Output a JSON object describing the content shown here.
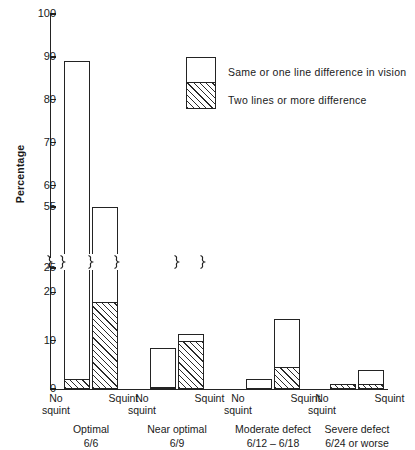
{
  "chart_data": {
    "type": "bar",
    "subtype": "stacked-grouped",
    "title": "",
    "xlabel": "",
    "ylabel": "Percentage",
    "ylim": [
      0,
      100
    ],
    "axis_break": {
      "present": true,
      "gap_from": 25,
      "gap_to": 55
    },
    "ytick_labels": [
      "0",
      "10",
      "20",
      "25",
      "55",
      "60",
      "70",
      "80",
      "90",
      "100"
    ],
    "ytick_values": [
      0,
      10,
      20,
      25,
      55,
      60,
      70,
      80,
      90,
      100
    ],
    "grid": false,
    "legend_position": "upper-right",
    "legend": [
      {
        "key": "same_or_one_line",
        "label": "Same or one line difference in vision",
        "fill": "white"
      },
      {
        "key": "two_or_more_lines",
        "label": "Two lines or more difference",
        "fill": "hatched"
      }
    ],
    "categories": [
      {
        "label": "Optimal",
        "sub": "6/6"
      },
      {
        "label": "Near optimal",
        "sub": "6/9"
      },
      {
        "label": "Moderate defect",
        "sub": "6/12 – 6/18"
      },
      {
        "label": "Severe defect",
        "sub": "6/24 or worse"
      }
    ],
    "subgroups": [
      {
        "line1": "No",
        "line2": "squint"
      },
      {
        "line1": "Squint",
        "line2": ""
      }
    ],
    "series": [
      {
        "name": "Two lines or more difference",
        "values": [
          [
            2.0,
            18.0
          ],
          [
            0.5,
            10.0
          ],
          [
            0.0,
            4.5
          ],
          [
            1.0,
            1.0
          ]
        ]
      },
      {
        "name": "Same or one line difference in vision",
        "values": [
          [
            87.0,
            37.0
          ],
          [
            8.0,
            15.5
          ],
          [
            2.0,
            10.0
          ],
          [
            0.0,
            3.0
          ]
        ]
      }
    ],
    "totals": [
      [
        89.0,
        55.0
      ],
      [
        8.5,
        25.5
      ],
      [
        2.0,
        14.5
      ],
      [
        1.0,
        4.0
      ]
    ]
  },
  "colors": {
    "ink": "#232323",
    "background": "#ffffff"
  }
}
